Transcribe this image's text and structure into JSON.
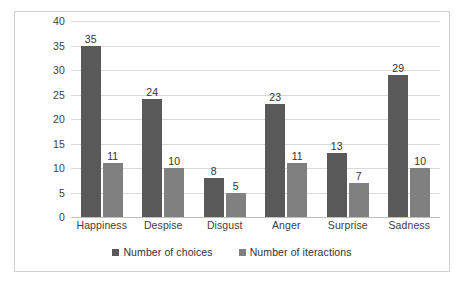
{
  "chart_data": {
    "type": "bar",
    "title": "",
    "subtitle": "",
    "xlabel": "",
    "ylabel": "",
    "categories": [
      "Happiness",
      "Despise",
      "Disgust",
      "Anger",
      "Surprise",
      "Sadness"
    ],
    "series": [
      {
        "name": "Number of choices",
        "color": "#595959",
        "values": [
          35,
          24,
          8,
          23,
          13,
          29
        ]
      },
      {
        "name": "Number of iteractions",
        "color": "#808080",
        "values": [
          11,
          10,
          5,
          11,
          7,
          10
        ]
      }
    ],
    "ylim": [
      0,
      40
    ],
    "y_ticks": [
      0,
      5,
      10,
      15,
      20,
      25,
      30,
      35,
      40
    ],
    "y_tick_labels": [
      "0",
      "5",
      "10",
      "15",
      "20",
      "25",
      "30",
      "35",
      "40"
    ],
    "grid": true,
    "grid_axis": "y",
    "grid_color": "#d9d9d9",
    "legend_position": "bottom",
    "data_labels": true,
    "plot_background": "#ffffff",
    "border_color": "#d0d0d0"
  }
}
